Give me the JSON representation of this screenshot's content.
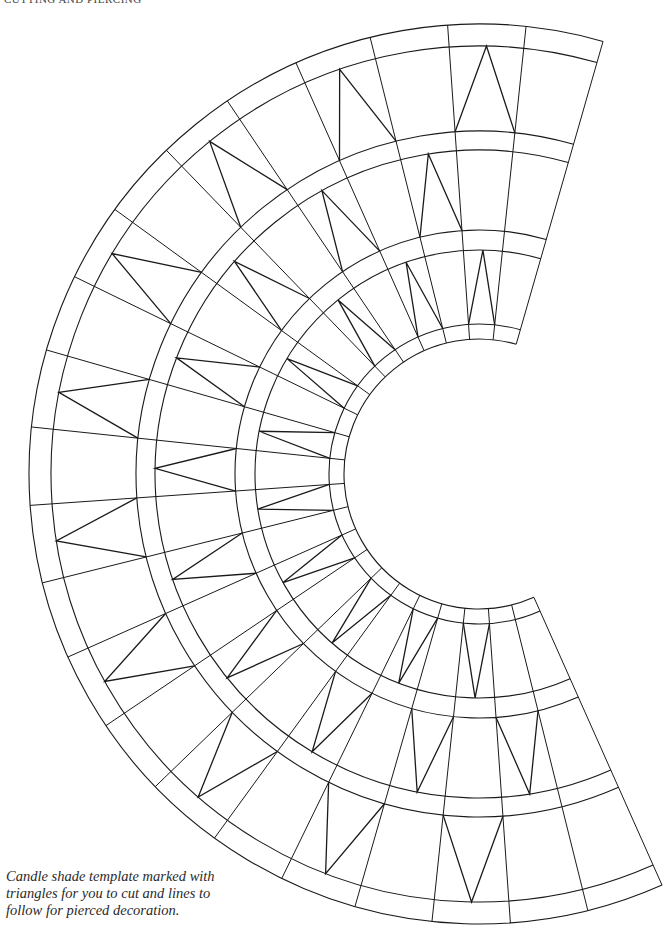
{
  "page": {
    "running_head": "CUTTING AND PIERCING",
    "caption_lines": [
      "Candle shade template marked with",
      "triangles for you to cut and lines to",
      "follow for pierced decoration."
    ]
  },
  "template": {
    "type": "annular-sector template (candle shade)",
    "center": [
      479,
      474
    ],
    "start_angle_deg": 66,
    "end_angle_deg": 286,
    "segment_count": 22,
    "segment_angle_deg": 10,
    "ring_radii": [
      450,
      428,
      343,
      324,
      244,
      224,
      150,
      135
    ],
    "radial_line_radii": [
      135,
      450
    ],
    "stroke_color": "#1a1a1a",
    "triangle_bands": [
      {
        "name": "outer-band",
        "apex_radius": 428,
        "base_radius": 343,
        "mid_angles_deg": [
          91,
          111,
          131,
          151,
          171,
          191,
          211,
          231,
          251,
          271
        ]
      },
      {
        "name": "middle-band",
        "apex_radius": 324,
        "base_radius": 244,
        "mid_angles_deg": [
          81,
          101,
          121,
          141,
          161,
          181,
          201,
          221,
          241,
          261
        ]
      },
      {
        "name": "inner-band",
        "apex_radius": 224,
        "base_radius": 150,
        "mid_angles_deg": [
          91,
          111,
          131,
          151,
          171,
          191,
          211,
          231,
          251,
          271
        ]
      }
    ]
  }
}
